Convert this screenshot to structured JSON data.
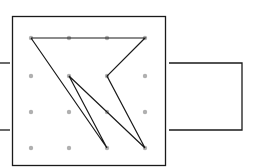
{
  "diagram": {
    "colors": {
      "line": "#1a1a1a",
      "dot": "#b0b0b0",
      "background": "#ffffff"
    },
    "board": {
      "x": 12.5,
      "y": 16.5,
      "width": 153,
      "height": 149
    },
    "grid_dots": {
      "columns_x": [
        31,
        69,
        107,
        145
      ],
      "rows_y": [
        38,
        76,
        112,
        148
      ],
      "radius": 2.2
    },
    "path_points": [
      [
        31,
        38
      ],
      [
        145,
        38
      ],
      [
        107,
        76
      ],
      [
        145,
        148
      ],
      [
        69,
        76
      ],
      [
        107,
        148
      ],
      [
        31,
        38
      ]
    ],
    "left_leads": [
      {
        "x1": 0,
        "y1": 63,
        "x2": 10,
        "y2": 63
      },
      {
        "x1": 0,
        "y1": 130,
        "x2": 10,
        "y2": 130
      }
    ],
    "right_loop": {
      "x1": 169,
      "x2": 242,
      "y_top": 63,
      "y_bottom": 130
    }
  }
}
